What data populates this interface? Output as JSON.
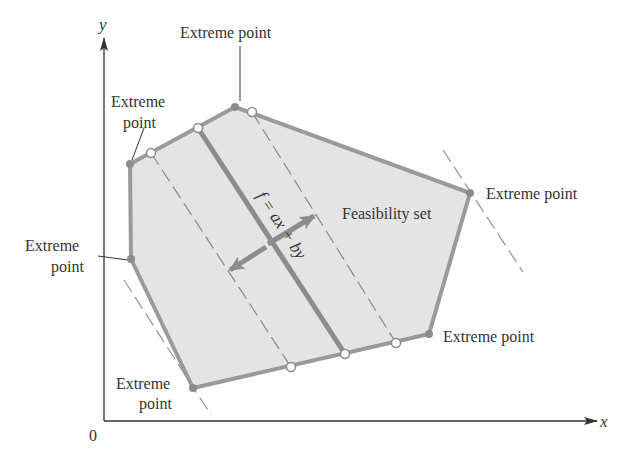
{
  "diagram": {
    "axes": {
      "x_label": "x",
      "y_label": "y",
      "origin_label": "0"
    },
    "region_label": "Feasibility set",
    "objective_label": "f = ax + by",
    "extreme_point_labels": {
      "top": "Extreme point",
      "upper_left_line1": "Extreme",
      "upper_left_line2": "point",
      "left_line1": "Extreme",
      "left_line2": "point",
      "bottom_line1": "Extreme",
      "bottom_line2": "point",
      "right": "Extreme point",
      "lower_right": "Extreme point"
    },
    "colors": {
      "region_fill": "#e4e4e4",
      "edge": "#9a9a9a",
      "objective_line": "#8c8c8c",
      "axis": "#333333",
      "text": "#333333"
    },
    "polygon_vertices": [
      [
        130,
        164
      ],
      [
        235,
        107
      ],
      [
        470,
        193
      ],
      [
        429,
        334
      ],
      [
        193,
        388
      ],
      [
        131,
        259
      ]
    ],
    "open_points": [
      [
        151,
        153
      ],
      [
        198,
        128
      ],
      [
        252,
        112
      ],
      [
        291,
        367
      ],
      [
        345,
        354
      ],
      [
        396,
        343
      ]
    ]
  }
}
